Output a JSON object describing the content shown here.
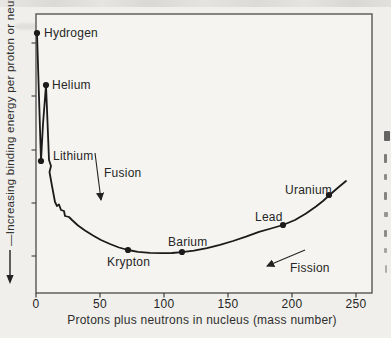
{
  "chart_data": {
    "type": "line",
    "title": "",
    "xlabel": "Protons plus neutrons in nucleus (mass number)",
    "ylabel": "Increasing binding energy per proton or neutron",
    "ylabel_display": "—Increasing binding energy per proton or neutron",
    "y_axis_note": "No numeric y scale; downward arrow on axis label indicates binding energy increases toward bottom of plot",
    "xlim": [
      0,
      262
    ],
    "grid": false,
    "legend": "none",
    "x_axis": {
      "ticks": [
        {
          "label": "0",
          "px": 36
        },
        {
          "label": "50",
          "px": 100
        },
        {
          "label": "100",
          "px": 164
        },
        {
          "label": "150",
          "px": 228
        },
        {
          "label": "200",
          "px": 292
        },
        {
          "label": "250",
          "px": 356
        }
      ]
    },
    "y_axis": {
      "tick_px": [
        43,
        96,
        150,
        203,
        256
      ]
    },
    "points": [
      {
        "label": "Hydrogen",
        "x_value": 1,
        "px": [
          37,
          33
        ],
        "label_px": [
          44,
          37
        ]
      },
      {
        "label": null,
        "x_value": 4,
        "px": [
          41,
          161
        ],
        "label_px": null
      },
      {
        "label": "Helium",
        "x_value": 8,
        "px": [
          46,
          85
        ],
        "label_px": [
          52,
          89
        ]
      },
      {
        "label": "Krypton",
        "x_value": 72,
        "px": [
          128,
          250
        ],
        "label_px": [
          107,
          266
        ]
      },
      {
        "label": "Barium",
        "x_value": 114,
        "px": [
          182,
          252
        ],
        "label_px": [
          168,
          246
        ]
      },
      {
        "label": "Lead",
        "x_value": 193,
        "px": [
          283,
          225
        ],
        "label_px": [
          255,
          221
        ]
      },
      {
        "label": "Uranium",
        "x_value": 229,
        "px": [
          329,
          195
        ],
        "label_px": [
          285,
          194
        ]
      }
    ],
    "region_labels": [
      {
        "label": "Lithium",
        "label_px": [
          53,
          160
        ]
      }
    ],
    "annotations": [
      {
        "label": "Fusion",
        "arrow_px": [
          95,
          153,
          101,
          200
        ],
        "label_px": [
          104,
          177
        ],
        "direction": "down"
      },
      {
        "label": "Fission",
        "arrow_px": [
          305,
          250,
          267,
          266
        ],
        "label_px": [
          290,
          272
        ],
        "direction": "down-left"
      }
    ],
    "curve_px": [
      [
        37,
        33
      ],
      [
        39,
        97
      ],
      [
        41,
        161
      ],
      [
        43,
        124
      ],
      [
        46,
        85
      ],
      [
        47.5,
        122
      ],
      [
        49,
        160
      ],
      [
        51,
        166
      ],
      [
        49.5,
        172
      ],
      [
        52,
        186
      ],
      [
        55,
        202
      ],
      [
        57,
        206
      ],
      [
        59,
        204.5
      ],
      [
        61,
        210
      ],
      [
        64,
        211
      ],
      [
        65,
        216
      ],
      [
        69,
        217
      ],
      [
        72,
        220
      ],
      [
        78,
        225.5
      ],
      [
        85,
        230.5
      ],
      [
        93,
        235.5
      ],
      [
        101,
        240
      ],
      [
        110,
        244
      ],
      [
        119,
        247.5
      ],
      [
        128,
        250
      ],
      [
        138,
        251.8
      ],
      [
        150,
        252.8
      ],
      [
        162,
        253.2
      ],
      [
        172,
        253
      ],
      [
        182,
        252.2
      ],
      [
        194,
        250.6
      ],
      [
        207,
        248.2
      ],
      [
        220,
        244.8
      ],
      [
        233,
        241
      ],
      [
        246,
        236.6
      ],
      [
        259,
        231.8
      ],
      [
        271,
        228.5
      ],
      [
        283,
        225
      ],
      [
        295,
        220
      ],
      [
        306,
        213.5
      ],
      [
        316,
        206.5
      ],
      [
        323,
        201
      ],
      [
        329,
        195.5
      ],
      [
        337,
        188.5
      ],
      [
        346,
        181
      ]
    ],
    "edge_fragments": [
      {
        "x": 384,
        "y": 131,
        "w": 6,
        "h": 10,
        "o": 0.85
      },
      {
        "x": 384,
        "y": 154,
        "w": 3,
        "h": 9,
        "o": 0.7
      },
      {
        "x": 384,
        "y": 174,
        "w": 3,
        "h": 6,
        "o": 0.6
      },
      {
        "x": 384,
        "y": 192,
        "w": 3,
        "h": 8,
        "o": 0.65
      },
      {
        "x": 384,
        "y": 212,
        "w": 4,
        "h": 5,
        "o": 0.55
      },
      {
        "x": 384,
        "y": 230,
        "w": 3,
        "h": 7,
        "o": 0.6
      },
      {
        "x": 384,
        "y": 248,
        "w": 3,
        "h": 5,
        "o": 0.45
      },
      {
        "x": 385,
        "y": 265,
        "w": 2,
        "h": 8,
        "o": 0.4
      }
    ],
    "style": {
      "line_color": "#1b1b1b",
      "frame_color": "#4a4a4a",
      "text_color": "#262626",
      "paper": "#f0efeb",
      "plot_bg": "#f5f4f0",
      "top_band": "#dcdbd7"
    }
  }
}
